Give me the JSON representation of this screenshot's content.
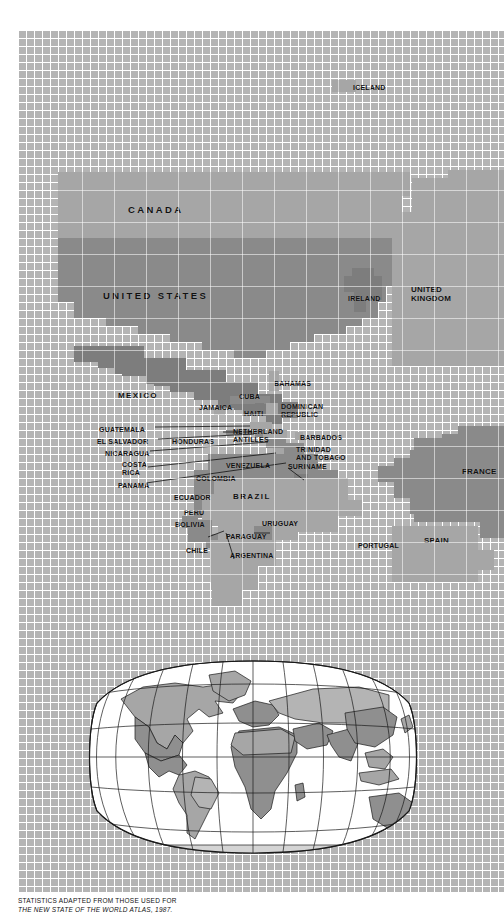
{
  "figure": {
    "type": "thematic-world-map",
    "background_pattern": "white-grid-on-gray",
    "caption_line1": "STATISTICS ADAPTED FROM THOSE USED FOR",
    "caption_line2": "THE NEW STATE OF THE WORLD ATLAS, 1987."
  },
  "palette": {
    "grid_background": "#b4b4b4",
    "grid_line": "#ffffff",
    "tone_light": "#b9b9b9",
    "tone_medium": "#a6a6a6",
    "tone_dark": "#8a8a8a",
    "tone_darker": "#7d7d7d",
    "label_text": "#111111",
    "inset_ocean": "#ffffff",
    "inset_outline": "#1a1a1a"
  },
  "main_map": {
    "region": "North Atlantic: the Americas and Western Europe",
    "labels": [
      {
        "name": "CANADA",
        "size": "s10",
        "x": 128,
        "y": 205
      },
      {
        "name": "UNITED STATES",
        "size": "s10",
        "x": 103,
        "y": 291
      },
      {
        "name": "MEXICO",
        "size": "s8w",
        "x": 118,
        "y": 392
      },
      {
        "name": "GUATEMALA",
        "size": "s7",
        "x": 99,
        "y": 426
      },
      {
        "name": "EL SALVADOR",
        "size": "s7",
        "x": 97,
        "y": 438
      },
      {
        "name": "NICARAGUA",
        "size": "s7",
        "x": 105,
        "y": 450
      },
      {
        "name": "COSTA",
        "size": "s7",
        "x": 122,
        "y": 461,
        "line2": "RICA"
      },
      {
        "name": "PANAMA",
        "size": "s7",
        "x": 118,
        "y": 482
      },
      {
        "name": "HONDURAS",
        "size": "s7",
        "x": 172,
        "y": 438
      },
      {
        "name": "JAMAICA",
        "size": "s7",
        "x": 199,
        "y": 404
      },
      {
        "name": "CUBA",
        "size": "s7",
        "x": 239,
        "y": 393
      },
      {
        "name": "HAITI",
        "size": "s7",
        "x": 244,
        "y": 410
      },
      {
        "name": "DOMINICAN",
        "size": "s7",
        "x": 281,
        "y": 403,
        "line2": "REPUBLIC"
      },
      {
        "name": "BAHAMAS",
        "size": "s7",
        "x": 274,
        "y": 380
      },
      {
        "name": "NETHERLAND",
        "size": "s7",
        "x": 233,
        "y": 428,
        "line2": "ANTILLES"
      },
      {
        "name": "BARBADOS",
        "size": "s7",
        "x": 300,
        "y": 434
      },
      {
        "name": "TRINIDAD",
        "size": "s7",
        "x": 296,
        "y": 446,
        "line2": "AND TOBAGO"
      },
      {
        "name": "VENEZUELA",
        "size": "s7",
        "x": 226,
        "y": 462
      },
      {
        "name": "SURINAME",
        "size": "s7",
        "x": 288,
        "y": 463
      },
      {
        "name": "COLOMBIA",
        "size": "s7",
        "x": 196,
        "y": 475
      },
      {
        "name": "ECUADOR",
        "size": "s7",
        "x": 174,
        "y": 494
      },
      {
        "name": "PERU",
        "size": "s7",
        "x": 184,
        "y": 509
      },
      {
        "name": "BOLIVIA",
        "size": "s7",
        "x": 175,
        "y": 521
      },
      {
        "name": "BRAZIL",
        "size": "s8w",
        "x": 233,
        "y": 493
      },
      {
        "name": "URUGUAY",
        "size": "s7",
        "x": 262,
        "y": 520
      },
      {
        "name": "PARAGUAY",
        "size": "s7",
        "x": 226,
        "y": 533
      },
      {
        "name": "CHILE",
        "size": "s7",
        "x": 186,
        "y": 547
      },
      {
        "name": "ARGENTINA",
        "size": "s7",
        "x": 230,
        "y": 552
      },
      {
        "name": "ICELAND",
        "size": "s7",
        "x": 353,
        "y": 84
      },
      {
        "name": "IRELAND",
        "size": "s7",
        "x": 348,
        "y": 295
      },
      {
        "name": "UNITED",
        "size": "s8",
        "x": 411,
        "y": 286,
        "line2": "KINGDOM"
      },
      {
        "name": "FRANCE",
        "size": "s8",
        "x": 462,
        "y": 468
      },
      {
        "name": "SPAIN",
        "size": "s8",
        "x": 424,
        "y": 537
      },
      {
        "name": "PORTUGAL",
        "size": "s7",
        "x": 358,
        "y": 542
      }
    ],
    "shading_classes": [
      {
        "tone": "tone_medium",
        "countries": [
          "CANADA",
          "BRAZIL",
          "ARGENTINA",
          "UNITED KINGDOM",
          "SPAIN",
          "ICELAND",
          "CHILE"
        ]
      },
      {
        "tone": "tone_dark",
        "countries": [
          "UNITED STATES",
          "MEXICO",
          "VENEZUELA",
          "COLOMBIA",
          "FRANCE",
          "IRELAND",
          "PERU",
          "BOLIVIA"
        ]
      }
    ]
  },
  "inset_map": {
    "projection": "Robinson",
    "graticule": {
      "meridians": 11,
      "parallels": 5,
      "visible": true
    },
    "ocean": "white",
    "description": "World locator map with all continents shaded in gray tones and country borders outlined"
  }
}
